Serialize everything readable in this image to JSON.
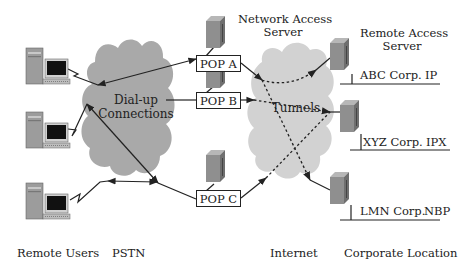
{
  "colors": {
    "pstn_cloud": "#a9a9a9",
    "internet_cloud": "#d2d2d2",
    "server_front": "#8f8f8f",
    "server_side": "#6f6f6f",
    "server_top": "#b7b7b7",
    "line": "#222222"
  },
  "headers": {
    "network_access_server": [
      "Network Access",
      "Server"
    ],
    "remote_access_server": [
      "Remote Access",
      "Server"
    ]
  },
  "clouds": {
    "pstn": {
      "label_line1": "Dial-up",
      "label_line2": "Connections"
    },
    "internet": {
      "label": "Tunnels"
    }
  },
  "pops": [
    {
      "id": "a",
      "label": "POP A"
    },
    {
      "id": "b",
      "label": "POP B"
    },
    {
      "id": "c",
      "label": "POP C"
    }
  ],
  "corporations": [
    {
      "name": "ABC Corp.",
      "protocol": "IP"
    },
    {
      "name": "XYZ Corp.",
      "protocol": "IPX"
    },
    {
      "name": "LMN Corp.",
      "protocol": "NBP"
    }
  ],
  "remote_users": [
    {
      "icon": "desktop-computer-icon"
    },
    {
      "icon": "desktop-computer-icon"
    },
    {
      "icon": "desktop-computer-icon"
    }
  ],
  "footer": {
    "remote_users": "Remote Users",
    "pstn": "PSTN",
    "internet": "Internet",
    "corporate_location": "Corporate Location"
  }
}
